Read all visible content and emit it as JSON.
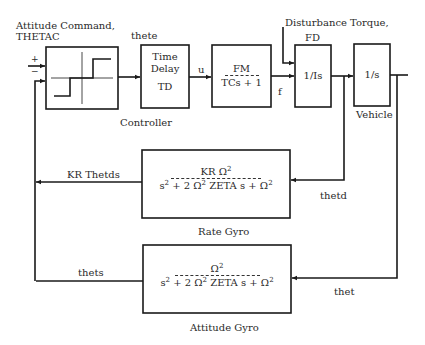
{
  "diagram": {
    "type": "block-diagram",
    "input": {
      "label_line1": "Attitude Command,",
      "label_line2": "THETAC",
      "plus_sign": "+",
      "minus_sign": "−"
    },
    "signals": {
      "error": "thete",
      "control": "u",
      "force": "f",
      "disturbance_line1": "Disturbance Torque,",
      "disturbance_line2": "FD",
      "rate": "thetd",
      "attitude": "thet",
      "rate_feedback": "KR Thetds",
      "attitude_feedback": "thets"
    },
    "blocks": {
      "controller": {
        "caption": "Controller"
      },
      "time_delay": {
        "line1": "Time",
        "line2": "Delay",
        "line3": "TD"
      },
      "actuator": {
        "numerator": "FM",
        "denominator": "TCs + 1"
      },
      "inertia": {
        "text": "1/Is"
      },
      "vehicle": {
        "text": "1/s",
        "caption": "Vehicle"
      },
      "rate_gyro": {
        "numerator_a": "KR Ω",
        "numerator_sup": "2",
        "den_s": "s",
        "den_s_sup": "2",
        "den_mid": " + 2 Ω",
        "den_mid_sup": "2",
        "den_end": " ZETA s + Ω",
        "den_end_sup": "2",
        "caption": "Rate Gyro"
      },
      "attitude_gyro": {
        "numerator_a": "Ω",
        "numerator_sup": "2",
        "den_s": "s",
        "den_s_sup": "2",
        "den_mid": " + 2 Ω",
        "den_mid_sup": "2",
        "den_end": " ZETA s + Ω",
        "den_end_sup": "2",
        "caption": "Attitude Gyro"
      }
    },
    "colors": {
      "line": "#1a1a1a",
      "background": "#ffffff"
    }
  }
}
